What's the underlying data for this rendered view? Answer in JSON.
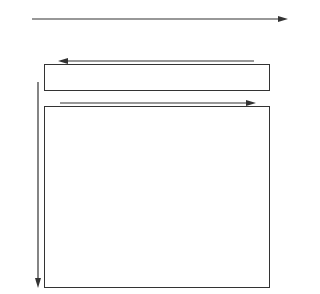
{
  "figure": {
    "background": "#ffffff",
    "tile_base_color": "#d4d4d4",
    "line_color": "#333333",
    "top_sequence": {
      "arrow_direction": "right",
      "tiles": [
        "#707070",
        "#b0b0b0",
        "#909090",
        "#a8a8a8",
        "#c8c8c8",
        "#989898",
        "#303030",
        "#404040",
        "#303030"
      ]
    },
    "strip": {
      "arrow_direction": "left",
      "tiles": [
        "#707070",
        "#808080",
        "#606060",
        "#c8c8c8",
        "#d0d0d0",
        "#404040",
        "#d0d0d0",
        "#a0a0a0",
        "#404040"
      ]
    },
    "grid": {
      "arrow_top_direction": "right",
      "arrow_left_direction": "down",
      "rows": [
        [
          "#808080",
          "#606060",
          "#808080",
          "#6a6a6a",
          "#a8a8a8",
          "#c0c0c0",
          "#b8b8b8",
          "#b0b0b0",
          "#303030"
        ],
        [
          "#c0c0c0",
          "#787878",
          "#505050",
          "#a8a8a8",
          "#c0c0c0",
          "#c8c8c8",
          "#b0b0b0",
          "#a0a0a0",
          "#404040"
        ],
        [
          "#909090",
          "#c8c8c8",
          "#404040",
          "#707070",
          "#606060",
          "#c0c0c0",
          "#a8a8a8",
          "#c8c8c8",
          "#909090"
        ],
        [
          "#c8c8c8",
          "#b8b8b8",
          "#c8c8c8",
          "#606060",
          "#505050",
          "#a8a8a8",
          "#b8b8b8",
          "#c8c8c8",
          "#c0c0c0"
        ],
        [
          "#e8e8e8",
          "#c8c8c8",
          "#909090",
          "#c8c8c8",
          "#202020",
          "#404040",
          "#202020",
          "#202020",
          "#c8c8c8"
        ],
        [
          "#c0c0c0",
          "#e8e8e8",
          "#c0c0c0",
          "#a8a8a8",
          "#c8c8c8",
          "#202020",
          "#202020",
          "#a8a8a8",
          "#202020"
        ],
        [
          "#e8e8e8",
          "#c0c0c0",
          "#a8a8a8",
          "#e8e8e8",
          "#a8a8a8",
          "#606060",
          "#404040",
          "#181818",
          "#181818"
        ]
      ]
    }
  }
}
